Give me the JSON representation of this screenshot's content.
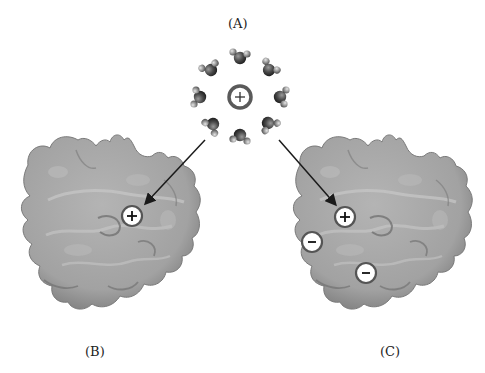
{
  "labels": {
    "a": "(A)",
    "b": "(B)",
    "c": "(C)"
  },
  "water_cluster": {
    "center_ion": "+",
    "oxygen": "O",
    "hydrogen": "H",
    "molecule_count": 10
  },
  "panel_b": {
    "charges": [
      "+"
    ]
  },
  "panel_c": {
    "charges": [
      "+",
      "−",
      "−"
    ]
  },
  "colors": {
    "protein": "#a4a4a4",
    "protein_shadow": "#6e6e6e",
    "protein_highlight": "#c6c6c6",
    "oxygen": "#4a4a4a",
    "hydrogen": "#8e8e8e",
    "arrow": "#1a1a1a",
    "charge_fill": "#ffffff",
    "charge_ring": "#555555"
  }
}
